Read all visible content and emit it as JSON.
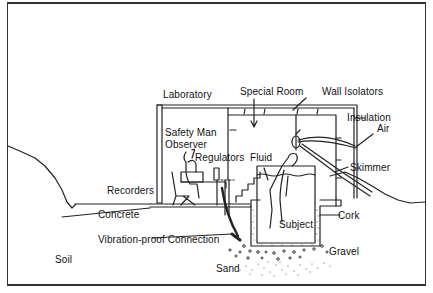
{
  "diagram": {
    "type": "cross-section illustration",
    "labels": {
      "laboratory": "Laboratory",
      "special_room": "Special Room",
      "wall_isolators": "Wall Isolators",
      "insulation": "Insulation",
      "air": "Air",
      "safety_man": "Safety Man",
      "observer": "Observer",
      "regulators": "Regulators",
      "fluid": "Fluid",
      "skimmer": "Skimmer",
      "recorders": "Recorders",
      "concrete": "Concrete",
      "cork": "Cork",
      "subject": "Subject",
      "vibration_proof_connection": "Vibration-proof Connection",
      "gravel": "Gravel",
      "soil": "Soil",
      "sand": "Sand"
    },
    "colors": {
      "line": "#222222",
      "background": "#ffffff"
    }
  }
}
